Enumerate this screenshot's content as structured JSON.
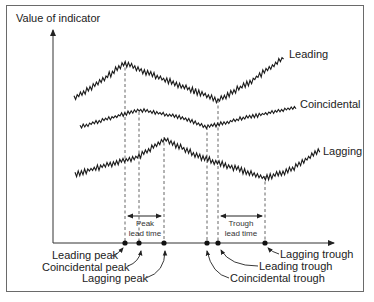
{
  "diagram": {
    "y_axis_label": "Value of indicator",
    "series_labels": {
      "leading": "Leading",
      "coincidental": "Coincidental",
      "lagging": "Lagging"
    },
    "peak_lead_time": {
      "line1": "Peak",
      "line2": "lead time"
    },
    "trough_lead_time": {
      "line1": "Trough",
      "line2": "lead time"
    },
    "points": {
      "leading_peak": "Leading peak",
      "coincidental_peak": "Coincidental peak",
      "lagging_peak": "Lagging peak",
      "lagging_trough": "Lagging trough",
      "leading_trough": "Leading trough",
      "coincidental_trough": "Coincidental trough"
    }
  }
}
